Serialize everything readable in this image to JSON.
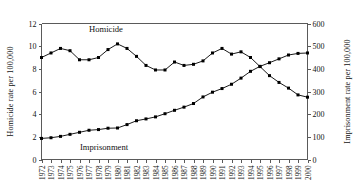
{
  "chart_data": {
    "type": "line",
    "title": "",
    "xlabel": "",
    "grid": false,
    "legend_position": "inline-annotation",
    "x": [
      1972,
      1973,
      1974,
      1975,
      1976,
      1977,
      1978,
      1979,
      1980,
      1981,
      1982,
      1983,
      1984,
      1985,
      1986,
      1987,
      1988,
      1989,
      1990,
      1991,
      1992,
      1993,
      1994,
      1995,
      1996,
      1997,
      1998,
      1999,
      2000
    ],
    "xticklabels": [
      "1972",
      "1973",
      "1974",
      "1975",
      "1976",
      "1977",
      "1978",
      "1979",
      "1980",
      "1981",
      "1982",
      "1983",
      "1984",
      "1985",
      "1986",
      "1987",
      "1988",
      "1989",
      "1990",
      "1991",
      "1992",
      "1993",
      "1994",
      "1995",
      "1996",
      "1997",
      "1998",
      "1999",
      "2000"
    ],
    "left_axis": {
      "label": "Homicide rate per 100,000",
      "ticks": [
        0,
        2,
        4,
        6,
        8,
        10,
        12
      ],
      "ticklabels": [
        "0",
        "2",
        "4",
        "6",
        "8",
        "10",
        "12"
      ],
      "ylim": [
        0,
        12
      ]
    },
    "right_axis": {
      "label": "Imprisonment rate per 100,000",
      "ticks": [
        0,
        100,
        200,
        300,
        400,
        500,
        600
      ],
      "ticklabels": [
        "0",
        "100",
        "200",
        "300",
        "400",
        "500",
        "600"
      ],
      "ylim": [
        0,
        600
      ]
    },
    "series": [
      {
        "name": "Homicide",
        "axis": "left",
        "annotation": "Homicide",
        "marker": "square",
        "color": "#000000",
        "values": [
          9.0,
          9.4,
          9.8,
          9.6,
          8.8,
          8.8,
          9.0,
          9.7,
          10.2,
          9.8,
          9.1,
          8.3,
          7.9,
          7.9,
          8.6,
          8.3,
          8.4,
          8.7,
          9.4,
          9.8,
          9.3,
          9.5,
          9.0,
          8.2,
          7.4,
          6.8,
          6.3,
          5.7,
          5.5
        ]
      },
      {
        "name": "Imprisonment",
        "axis": "right",
        "annotation": "Imprisonment",
        "marker": "square",
        "color": "#000000",
        "values": [
          93,
          96,
          102,
          111,
          120,
          129,
          132,
          138,
          139,
          154,
          171,
          179,
          188,
          202,
          217,
          231,
          247,
          276,
          297,
          313,
          332,
          359,
          389,
          411,
          427,
          444,
          461,
          468,
          470
        ]
      }
    ]
  },
  "annotations": {
    "homicide_label": "Homicide",
    "imprisonment_label": "Imprisonment"
  }
}
